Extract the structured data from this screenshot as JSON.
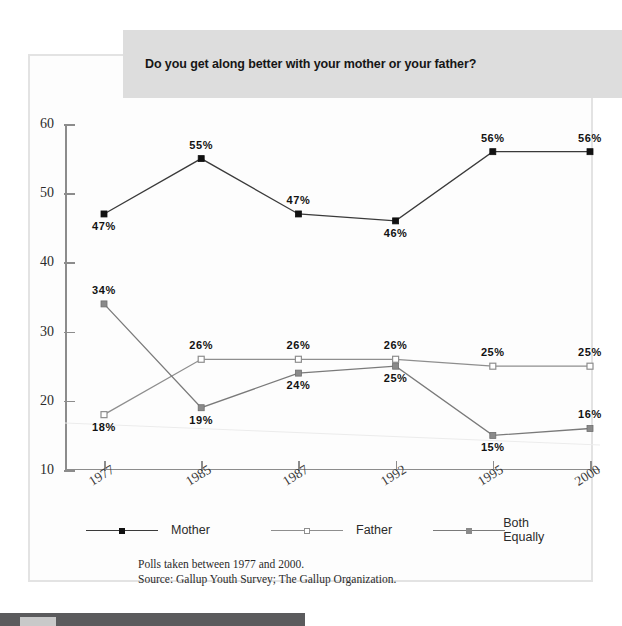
{
  "banner": {
    "title": "Do you get along better with your mother or your father?",
    "bg_color": "#dddddd"
  },
  "footnote": {
    "line1": "Polls taken between 1977 and 2000.",
    "line2": "Source: Gallup Youth Survey; The Gallup Organization."
  },
  "legend": {
    "items": [
      {
        "label": "Mother",
        "color": "#3a3a3a",
        "marker": "filled-square-black",
        "marker_fill": "#111111"
      },
      {
        "label": "Father",
        "color": "#8e8e8e",
        "marker": "open-square",
        "marker_fill": "#ffffff"
      },
      {
        "label": "Both Equally",
        "color": "#7a7a7a",
        "marker": "filled-square-gray",
        "marker_fill": "#8a8a8a"
      }
    ]
  },
  "chart_data": {
    "type": "line",
    "title": "Do you get along better with your mother or your father?",
    "xlabel": "",
    "ylabel": "",
    "categories": [
      "1977",
      "1985",
      "1987",
      "1992",
      "1995",
      "2000"
    ],
    "ylim": [
      10,
      60
    ],
    "yticks": [
      10,
      20,
      30,
      40,
      50,
      60
    ],
    "grid": false,
    "legend_position": "bottom",
    "value_suffix": "%",
    "series": [
      {
        "name": "Mother",
        "color": "#3a3a3a",
        "marker": "filled-square-black",
        "values": [
          47,
          55,
          47,
          46,
          56,
          56
        ],
        "labels": [
          "47%",
          "55%",
          "47%",
          "46%",
          "56%",
          "56%"
        ],
        "label_positions": [
          "below",
          "above",
          "above",
          "below",
          "above",
          "above"
        ]
      },
      {
        "name": "Father",
        "color": "#8e8e8e",
        "marker": "open-square",
        "values": [
          18,
          26,
          26,
          26,
          25,
          25
        ],
        "labels": [
          "18%",
          "26%",
          "26%",
          "26%",
          "25%",
          "25%"
        ],
        "label_positions": [
          "below",
          "above",
          "above",
          "above",
          "above",
          "above"
        ]
      },
      {
        "name": "Both Equally",
        "color": "#7a7a7a",
        "marker": "filled-square-gray",
        "values": [
          34,
          19,
          24,
          25,
          15,
          16
        ],
        "labels": [
          "34%",
          "19%",
          "24%",
          "25%",
          "15%",
          "16%"
        ],
        "label_positions": [
          "above",
          "below",
          "below",
          "below",
          "below",
          "above"
        ]
      }
    ]
  }
}
